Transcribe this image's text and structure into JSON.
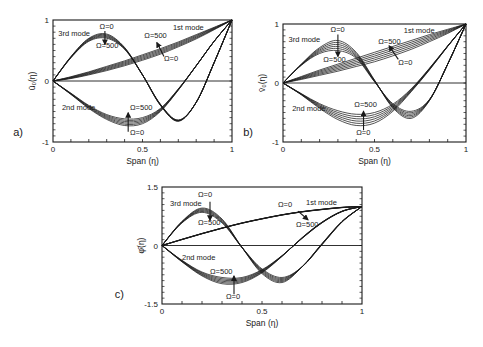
{
  "chart_data": [
    {
      "id": "a",
      "type": "line",
      "panel_label": "a)",
      "xlabel": "Span (η)",
      "ylabel": "ū₀(η)",
      "xlim": [
        0,
        1
      ],
      "ylim": [
        -1,
        1
      ],
      "xticks": [
        {
          "v": 0,
          "label": "0"
        },
        {
          "v": 0.5,
          "label": "0.5"
        },
        {
          "v": 1,
          "label": "1"
        }
      ],
      "yticks": [
        {
          "v": -1,
          "label": "-1"
        },
        {
          "v": 0,
          "label": "0"
        },
        {
          "v": 1,
          "label": "1"
        }
      ],
      "zero_line": true,
      "frame": {
        "x0": 53,
        "y0": 20,
        "x1": 232,
        "y1": 142
      },
      "parameter": "Ω",
      "parameter_values": [
        0,
        100,
        200,
        300,
        400,
        500
      ],
      "series": [
        {
          "name": "1st mode",
          "x": [
            0,
            0.1,
            0.2,
            0.3,
            0.4,
            0.5,
            0.6,
            0.7,
            0.8,
            0.9,
            1.0
          ],
          "omega0": [
            0,
            0.04,
            0.1,
            0.17,
            0.25,
            0.34,
            0.44,
            0.56,
            0.69,
            0.84,
            1.0
          ],
          "omega500": [
            0,
            0.07,
            0.15,
            0.24,
            0.33,
            0.43,
            0.53,
            0.64,
            0.76,
            0.88,
            1.0
          ]
        },
        {
          "name": "2nd mode",
          "x": [
            0,
            0.1,
            0.2,
            0.3,
            0.4,
            0.5,
            0.6,
            0.7,
            0.8,
            0.9,
            1.0
          ],
          "omega0": [
            0,
            -0.22,
            -0.45,
            -0.63,
            -0.73,
            -0.7,
            -0.5,
            -0.15,
            0.25,
            0.65,
            1.0
          ],
          "omega500": [
            0,
            -0.2,
            -0.4,
            -0.55,
            -0.62,
            -0.6,
            -0.45,
            -0.13,
            0.25,
            0.65,
            1.0
          ]
        },
        {
          "name": "3rd mode",
          "x": [
            0,
            0.1,
            0.2,
            0.3,
            0.4,
            0.5,
            0.6,
            0.7,
            0.8,
            0.9,
            1.0
          ],
          "omega0": [
            0,
            0.4,
            0.7,
            0.77,
            0.55,
            0.1,
            -0.4,
            -0.66,
            -0.35,
            0.3,
            1.0
          ],
          "omega500": [
            0,
            0.38,
            0.65,
            0.7,
            0.52,
            0.1,
            -0.38,
            -0.64,
            -0.35,
            0.3,
            1.0
          ]
        }
      ],
      "annotations": [
        {
          "text": "3rd mode",
          "x": 0.03,
          "y": 0.73
        },
        {
          "text": "Ω=0",
          "x": 0.26,
          "y": 0.86
        },
        {
          "text": "Ω=500",
          "x": 0.24,
          "y": 0.54
        },
        {
          "text": "1st mode",
          "x": 0.67,
          "y": 0.84
        },
        {
          "text": "Ω=500",
          "x": 0.51,
          "y": 0.7
        },
        {
          "text": "Ω=0",
          "x": 0.62,
          "y": 0.32
        },
        {
          "text": "2nd mode",
          "x": 0.05,
          "y": -0.48
        },
        {
          "text": "Ω=500",
          "x": 0.43,
          "y": -0.48
        },
        {
          "text": "Ω=0",
          "x": 0.43,
          "y": -0.89
        }
      ],
      "arrows": [
        {
          "x": 0.29,
          "y1": 0.82,
          "y2": 0.6
        },
        {
          "x": 0.42,
          "y1": -0.83,
          "y2": -0.52
        },
        {
          "x1": 0.62,
          "y1": 0.4,
          "x2": 0.58,
          "y2": 0.63
        }
      ]
    },
    {
      "id": "b",
      "type": "line",
      "panel_label": "b)",
      "xlabel": "Span (η)",
      "ylabel": "v̄₀(η)",
      "xlim": [
        0,
        1
      ],
      "ylim": [
        -1,
        1
      ],
      "xticks": [
        {
          "v": 0,
          "label": "0"
        },
        {
          "v": 0.5,
          "label": "0.5"
        },
        {
          "v": 1,
          "label": "1"
        }
      ],
      "yticks": [
        {
          "v": -1,
          "label": "-1"
        },
        {
          "v": 0,
          "label": "0"
        },
        {
          "v": 1,
          "label": "1"
        }
      ],
      "zero_line": true,
      "frame": {
        "x0": 283,
        "y0": 24,
        "x1": 466,
        "y1": 142
      },
      "parameter": "Ω",
      "parameter_values": [
        0,
        100,
        200,
        300,
        400,
        500
      ],
      "series": [
        {
          "name": "1st mode",
          "x": [
            0,
            0.1,
            0.2,
            0.3,
            0.4,
            0.5,
            0.6,
            0.7,
            0.8,
            0.9,
            1.0
          ],
          "omega0": [
            0,
            0.06,
            0.13,
            0.2,
            0.28,
            0.36,
            0.46,
            0.57,
            0.7,
            0.84,
            1.0
          ],
          "omega500": [
            0,
            0.11,
            0.22,
            0.32,
            0.42,
            0.52,
            0.62,
            0.72,
            0.82,
            0.91,
            1.0
          ]
        },
        {
          "name": "2nd mode",
          "x": [
            0,
            0.1,
            0.2,
            0.3,
            0.4,
            0.5,
            0.6,
            0.7,
            0.8,
            0.9,
            1.0
          ],
          "omega0": [
            0,
            -0.2,
            -0.43,
            -0.62,
            -0.72,
            -0.68,
            -0.48,
            -0.15,
            0.22,
            0.62,
            1.0
          ],
          "omega500": [
            0,
            -0.18,
            -0.35,
            -0.47,
            -0.53,
            -0.5,
            -0.36,
            -0.1,
            0.25,
            0.63,
            1.0
          ]
        },
        {
          "name": "3rd mode",
          "x": [
            0,
            0.1,
            0.2,
            0.3,
            0.4,
            0.5,
            0.6,
            0.7,
            0.8,
            0.9,
            1.0
          ],
          "omega0": [
            0,
            0.32,
            0.6,
            0.72,
            0.52,
            0.05,
            -0.42,
            -0.6,
            -0.3,
            0.32,
            1.0
          ],
          "omega500": [
            0,
            0.3,
            0.5,
            0.55,
            0.42,
            0.02,
            -0.35,
            -0.48,
            -0.28,
            0.32,
            1.0
          ]
        }
      ],
      "annotations": [
        {
          "text": "3rd mode",
          "x": 0.03,
          "y": 0.7
        },
        {
          "text": "Ω=0",
          "x": 0.26,
          "y": 0.86
        },
        {
          "text": "Ω=500",
          "x": 0.22,
          "y": 0.36
        },
        {
          "text": "1st mode",
          "x": 0.66,
          "y": 0.84
        },
        {
          "text": "Ω=500",
          "x": 0.52,
          "y": 0.66
        },
        {
          "text": "Ω=0",
          "x": 0.63,
          "y": 0.3
        },
        {
          "text": "2nd mode",
          "x": 0.05,
          "y": -0.48
        },
        {
          "text": "Ω=500",
          "x": 0.39,
          "y": -0.4
        },
        {
          "text": "Ω=0",
          "x": 0.4,
          "y": -0.88
        }
      ],
      "arrows": [
        {
          "x": 0.3,
          "y1": 0.82,
          "y2": 0.45
        },
        {
          "x": 0.44,
          "y1": -0.8,
          "y2": -0.48
        },
        {
          "x1": 0.63,
          "y1": 0.4,
          "x2": 0.58,
          "y2": 0.63
        }
      ]
    },
    {
      "id": "c",
      "type": "line",
      "panel_label": "c)",
      "xlabel": "Span (η)",
      "ylabel": "φ̄(η)",
      "xlim": [
        0,
        1
      ],
      "ylim": [
        -1.5,
        1.5
      ],
      "xticks": [
        {
          "v": 0,
          "label": "0"
        },
        {
          "v": 0.5,
          "label": "0.5"
        },
        {
          "v": 1,
          "label": "1"
        }
      ],
      "yticks": [
        {
          "v": -1.5,
          "label": "-1.5"
        },
        {
          "v": 0,
          "label": "0"
        },
        {
          "v": 1.5,
          "label": "1.5"
        }
      ],
      "zero_line": true,
      "frame": {
        "x0": 162,
        "y0": 187,
        "x1": 362,
        "y1": 304
      },
      "parameter": "Ω",
      "parameter_values": [
        0,
        100,
        200,
        300,
        400,
        500
      ],
      "series": [
        {
          "name": "1st mode",
          "x": [
            0,
            0.1,
            0.2,
            0.3,
            0.4,
            0.5,
            0.6,
            0.7,
            0.8,
            0.9,
            1.0
          ],
          "omega0": [
            0,
            0.16,
            0.31,
            0.45,
            0.58,
            0.69,
            0.79,
            0.87,
            0.93,
            0.98,
            1.0
          ],
          "omega500": [
            0,
            0.15,
            0.3,
            0.44,
            0.57,
            0.68,
            0.78,
            0.86,
            0.92,
            0.97,
            1.0
          ]
        },
        {
          "name": "2nd mode",
          "x": [
            0,
            0.1,
            0.2,
            0.3,
            0.4,
            0.5,
            0.6,
            0.7,
            0.8,
            0.9,
            1.0
          ],
          "omega0": [
            0,
            -0.42,
            -0.78,
            -0.98,
            -0.95,
            -0.7,
            -0.28,
            0.2,
            0.6,
            0.88,
            1.0
          ],
          "omega500": [
            0,
            -0.38,
            -0.68,
            -0.82,
            -0.82,
            -0.62,
            -0.26,
            0.18,
            0.58,
            0.87,
            1.0
          ]
        },
        {
          "name": "3rd mode",
          "x": [
            0,
            0.1,
            0.2,
            0.3,
            0.4,
            0.5,
            0.6,
            0.7,
            0.8,
            0.9,
            1.0
          ],
          "omega0": [
            0,
            0.62,
            0.96,
            0.68,
            -0.05,
            -0.72,
            -0.95,
            -0.55,
            0.05,
            0.62,
            1.0
          ],
          "omega500": [
            0,
            0.58,
            0.85,
            0.58,
            -0.05,
            -0.6,
            -0.82,
            -0.55,
            0.02,
            0.6,
            1.0
          ]
        }
      ],
      "annotations": [
        {
          "text": "3rd mode",
          "x": 0.04,
          "y": 1.02
        },
        {
          "text": "Ω=0",
          "x": 0.18,
          "y": 1.24
        },
        {
          "text": "Ω=500",
          "x": 0.18,
          "y": 0.52
        },
        {
          "text": "1st mode",
          "x": 0.72,
          "y": 1.03
        },
        {
          "text": "Ω=0",
          "x": 0.58,
          "y": 1.0
        },
        {
          "text": "Ω=500",
          "x": 0.67,
          "y": 0.48
        },
        {
          "text": "2nd mode",
          "x": 0.1,
          "y": -0.38
        },
        {
          "text": "Ω=500",
          "x": 0.24,
          "y": -0.72
        },
        {
          "text": "Ω=0",
          "x": 0.32,
          "y": -1.38
        }
      ],
      "arrows": [
        {
          "x": 0.24,
          "y1": 1.12,
          "y2": 0.65
        },
        {
          "x": 0.36,
          "y1": -1.25,
          "y2": -0.78
        },
        {
          "x1": 0.68,
          "y1": 0.88,
          "x2": 0.73,
          "y2": 0.66
        }
      ]
    }
  ],
  "colors": {
    "ink": "#1a1a1a",
    "background": "#ffffff"
  }
}
